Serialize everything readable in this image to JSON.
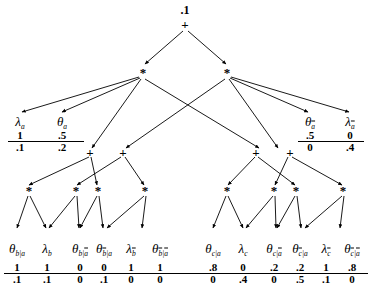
{
  "diagram": {
    "root": {
      "value": ".1",
      "op": "+"
    },
    "operators": {
      "plus": "+",
      "times": "*"
    },
    "level_times_top": [
      {
        "id": "t1",
        "op": "*"
      },
      {
        "id": "t2",
        "op": "*"
      }
    ],
    "level_plus_mid": [
      {
        "id": "p1",
        "op": "+"
      },
      {
        "id": "p2",
        "op": "+"
      },
      {
        "id": "p3",
        "op": "+"
      },
      {
        "id": "p4",
        "op": "+"
      }
    ],
    "level_times_low": [
      {
        "id": "s1",
        "op": "*"
      },
      {
        "id": "s2",
        "op": "*"
      },
      {
        "id": "s3",
        "op": "*"
      },
      {
        "id": "s4",
        "op": "*"
      },
      {
        "id": "s5",
        "op": "*"
      },
      {
        "id": "s6",
        "op": "*"
      },
      {
        "id": "s7",
        "op": "*"
      },
      {
        "id": "s8",
        "op": "*"
      }
    ],
    "top_leaves": [
      {
        "id": "tl1",
        "symbol": "λ",
        "sub": "a",
        "sub_bar": false,
        "num": "1",
        "den": ".1"
      },
      {
        "id": "tl2",
        "symbol": "θ",
        "sub": "a",
        "sub_bar": false,
        "num": ".5",
        "den": ".2"
      },
      {
        "id": "tl3",
        "symbol": "θ",
        "sub": "a",
        "sub_bar": true,
        "num": ".5",
        "den": "0"
      },
      {
        "id": "tl4",
        "symbol": "λ",
        "sub": "a",
        "sub_bar": true,
        "num": "0",
        "den": ".4"
      }
    ],
    "bottom_leaves": [
      {
        "id": "b1",
        "symbol": "θ",
        "sub": "b|a",
        "bar_vars": [],
        "num": "1",
        "den": ".1"
      },
      {
        "id": "b2",
        "symbol": "λ",
        "sub": "b",
        "bar_vars": [],
        "num": "1",
        "den": ".1"
      },
      {
        "id": "b3",
        "symbol": "θ",
        "sub": "b|a",
        "bar_vars": [
          "a"
        ],
        "num": "0",
        "den": "0"
      },
      {
        "id": "b4",
        "symbol": "θ",
        "sub": "b|a",
        "bar_vars": [
          "b"
        ],
        "num": "0",
        "den": ".1"
      },
      {
        "id": "b5",
        "symbol": "λ",
        "sub": "b",
        "bar_vars": [
          "b"
        ],
        "num": "1",
        "den": "0"
      },
      {
        "id": "b6",
        "symbol": "θ",
        "sub": "b|a",
        "bar_vars": [
          "b",
          "a"
        ],
        "num": "1",
        "den": "0"
      },
      {
        "id": "b7",
        "symbol": "θ",
        "sub": "c|a",
        "bar_vars": [],
        "num": ".8",
        "den": "0"
      },
      {
        "id": "b8",
        "symbol": "λ",
        "sub": "c",
        "bar_vars": [],
        "num": "0",
        "den": ".4"
      },
      {
        "id": "b9",
        "symbol": "θ",
        "sub": "c|a",
        "bar_vars": [
          "a"
        ],
        "num": ".2",
        "den": "0"
      },
      {
        "id": "b10",
        "symbol": "θ",
        "sub": "c|a",
        "bar_vars": [
          "c"
        ],
        "num": ".2",
        "den": ".5"
      },
      {
        "id": "b11",
        "symbol": "λ",
        "sub": "c",
        "bar_vars": [
          "c"
        ],
        "num": "1",
        "den": ".1"
      },
      {
        "id": "b12",
        "symbol": "θ",
        "sub": "c|a",
        "bar_vars": [
          "c",
          "a"
        ],
        "num": ".8",
        "den": "0"
      }
    ],
    "colors": {
      "ink": "#000000",
      "background": "#ffffff"
    }
  }
}
